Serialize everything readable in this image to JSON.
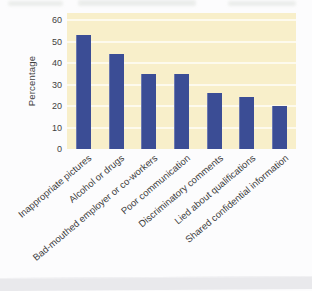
{
  "chart_data": {
    "type": "bar",
    "title": "",
    "ylabel": "Percentage",
    "xlabel": "",
    "categories": [
      "Inappropriate pictures",
      "Alcohol or drugs",
      "Bad-mouthed employer or co-workers",
      "Poor communication",
      "Discriminatory comments",
      "Lied about qualifications",
      "Shared confidential information"
    ],
    "values": [
      53,
      44,
      35,
      35,
      26,
      24,
      20
    ],
    "ylim": [
      0,
      60
    ],
    "yticks": [
      0,
      10,
      20,
      30,
      40,
      50,
      60
    ],
    "grid": "horizontal white lines",
    "legend": "none",
    "colors": {
      "bar": "#3b4d95",
      "plot_background": "#f8efca",
      "gridline": "#ffffff",
      "text": "#3f3f3f",
      "page_background": "#fcfcfd",
      "page_edge": "#e9e9ec"
    }
  }
}
